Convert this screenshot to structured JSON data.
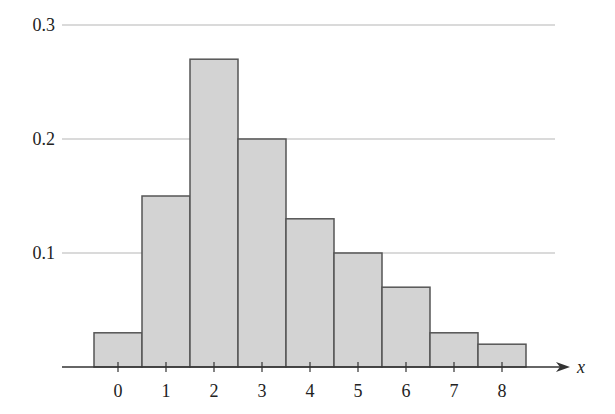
{
  "chart_data": {
    "type": "bar",
    "title": "",
    "xlabel": "x",
    "ylabel": "",
    "categories": [
      "0",
      "1",
      "2",
      "3",
      "4",
      "5",
      "6",
      "7",
      "8"
    ],
    "values": [
      0.03,
      0.15,
      0.27,
      0.2,
      0.13,
      0.1,
      0.07,
      0.03,
      0.02
    ],
    "ylim": [
      0,
      0.3
    ],
    "yticks": [
      "0.1",
      "0.2",
      "0.3"
    ],
    "ytick_values": [
      0.1,
      0.2,
      0.3
    ],
    "grid": "horizontal",
    "legend": null,
    "bar_style": "adjacent (histogram)"
  },
  "colors": {
    "bar_fill": "#d3d3d3",
    "bar_edge": "#555555",
    "gridline": "#b5b5b5",
    "axis": "#333333",
    "text": "#222222"
  },
  "layout": {
    "baseline_y": 367,
    "px_per_unit": 1140,
    "first_tick_x": 118,
    "bar_width": 48,
    "axis_start_x": 62,
    "axis_end_x": 570,
    "grid_end_x": 555
  }
}
